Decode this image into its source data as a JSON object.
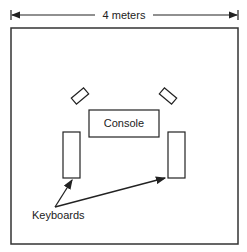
{
  "diagram": {
    "dimension_label": "4 meters",
    "room_label": "",
    "console_label": "Console",
    "keyboards_label": "Keyboards",
    "elements": {
      "speakers": [
        "left-speaker",
        "right-speaker"
      ],
      "keyboards": [
        "left-keyboard",
        "right-keyboard"
      ],
      "console": "console"
    },
    "colors": {
      "stroke": "#222222",
      "background": "#ffffff"
    }
  }
}
